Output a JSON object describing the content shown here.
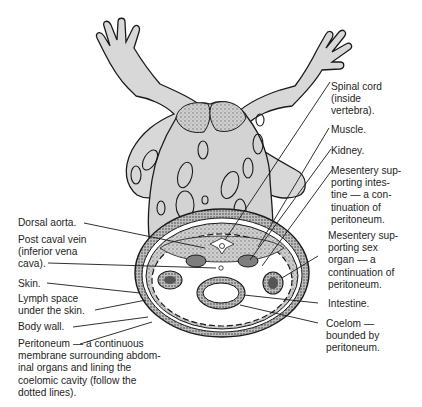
{
  "diagram": {
    "labels_right": [
      {
        "id": "spinal-cord",
        "text": "Spinal cord\n(inside\nvertebra)."
      },
      {
        "id": "muscle",
        "text": "Muscle."
      },
      {
        "id": "kidney",
        "text": "Kidney."
      },
      {
        "id": "mesentery-intestine",
        "text": "Mesentery sup-\nporting intes-\ntine — a con-\ntinuation of\nperitoneum."
      },
      {
        "id": "mesentery-sex-organ",
        "text": "Mesentery sup-\nporting sex\norgan — a\ncontinuation of\nperitoneum."
      },
      {
        "id": "intestine",
        "text": "Intestine."
      },
      {
        "id": "coelom",
        "text": "Coelom —\nbounded by\nperitoneum."
      }
    ],
    "labels_left": [
      {
        "id": "dorsal-aorta",
        "text": "Dorsal aorta."
      },
      {
        "id": "post-caval-vein",
        "text": "Post caval vein\n(inferior vena\ncava)."
      },
      {
        "id": "skin",
        "text": "Skin."
      },
      {
        "id": "lymph-space",
        "text": "Lymph space\nunder the skin."
      },
      {
        "id": "body-wall",
        "text": "Body wall."
      },
      {
        "id": "peritoneum",
        "text": "Peritoneum — a continuous\nmembrane surrounding abdom-\ninal organs and lining the\ncoelomic cavity (follow the\ndotted lines)."
      }
    ],
    "colors": {
      "body_fill": "#d6d6d6",
      "line": "#1a1a1a",
      "organ_fill": "#8a8a8a",
      "background": "#ffffff"
    }
  }
}
